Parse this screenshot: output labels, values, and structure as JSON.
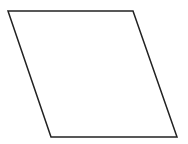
{
  "diagram": {
    "shape": "parallelogram",
    "points": "8,11 133,11 177,137 51,137",
    "stroke": "#222222",
    "fill": "#ffffff",
    "stroke_width": "1.5"
  }
}
